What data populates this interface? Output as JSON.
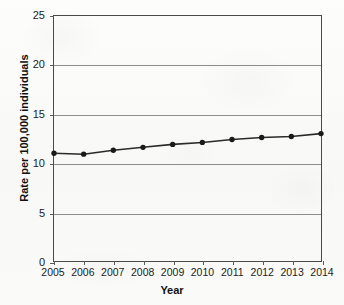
{
  "chart_data": {
    "type": "line",
    "title": "",
    "xlabel": "Year",
    "ylabel": "Rate per 100,000 individuals",
    "categories": [
      "2005",
      "2006",
      "2007",
      "2008",
      "2009",
      "2010",
      "2011",
      "2012",
      "2013",
      "2014"
    ],
    "x": [
      2005,
      2006,
      2007,
      2008,
      2009,
      2010,
      2011,
      2012,
      2013,
      2014
    ],
    "values": [
      11.0,
      10.9,
      11.3,
      11.6,
      11.9,
      12.1,
      12.4,
      12.6,
      12.7,
      13.0
    ],
    "series": [
      {
        "name": "Rate",
        "values": [
          11.0,
          10.9,
          11.3,
          11.6,
          11.9,
          12.1,
          12.4,
          12.6,
          12.7,
          13.0
        ]
      }
    ],
    "yticks": [
      0,
      5,
      10,
      15,
      20,
      25
    ],
    "ytick_labels": [
      "0",
      "5",
      "10",
      "15",
      "20",
      "25"
    ],
    "ylim": [
      0,
      25
    ],
    "xlim": [
      2005,
      2014
    ],
    "grid": "horizontal",
    "legend": "none",
    "marker": "circle",
    "line_color": "#2b2b2b",
    "marker_color": "#1a1a1a",
    "grid_color": "#8d8d8d",
    "axis_color": "#4a4a4a",
    "background_color": "#fbfbfa"
  }
}
